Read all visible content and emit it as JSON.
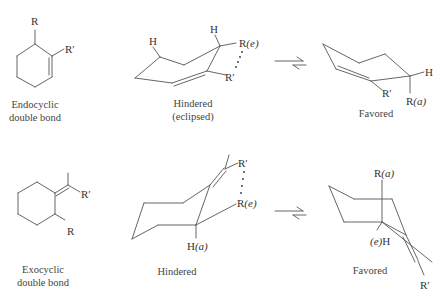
{
  "row_endocyclic": {
    "flat_structure": {
      "substituents": {
        "top": "R",
        "right": "R′"
      },
      "caption_line1": "Endocyclic",
      "caption_line2": "double bond"
    },
    "hindered_conformer": {
      "labels": {
        "h_left": "H",
        "h_right": "H",
        "r_equatorial": "R(e)",
        "r_prime": "R′"
      },
      "r_e_main": "R",
      "r_e_paren": "(e)",
      "caption_line1": "Hindered",
      "caption_line2": "(eclipsed)"
    },
    "equilibrium_arrow": "⇌",
    "favored_conformer": {
      "labels": {
        "h": "H",
        "r_prime": "R′"
      },
      "r_a_main": "R",
      "r_a_paren": "(a)",
      "caption": "Favored"
    }
  },
  "row_exocyclic": {
    "flat_structure": {
      "substituents": {
        "right": "R′",
        "bottom": "R"
      },
      "caption_line1": "Exocyclic",
      "caption_line2": "double bond"
    },
    "hindered_conformer": {
      "labels": {
        "r_prime": "R′"
      },
      "r_e_main": "R",
      "r_e_paren": "(e)",
      "h_a_main": "H",
      "h_a_paren": "(a)",
      "caption": "Hindered"
    },
    "equilibrium_arrow": "⇌",
    "favored_conformer": {
      "labels": {
        "r_prime": "R′"
      },
      "r_a_main": "R",
      "r_a_paren": "(a)",
      "e_h_paren": "(e)",
      "e_h_main": "H",
      "caption": "Favored"
    }
  }
}
